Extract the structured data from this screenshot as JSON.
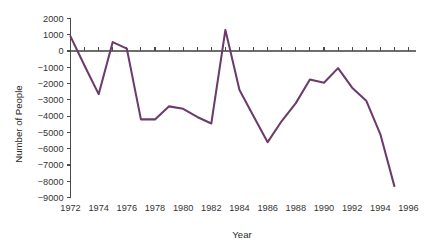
{
  "chart_data": {
    "type": "line",
    "title": "",
    "xlabel": "Year",
    "ylabel": "Number of People",
    "xlim": [
      1972,
      1996.5
    ],
    "ylim": [
      -9000,
      2000
    ],
    "grid": false,
    "legend": null,
    "line_color": "#6b3b6b",
    "axis_color": "#4a4a4a",
    "text_color": "#333333",
    "background_color": "#ffffff",
    "x_tick_labels": [
      "1972",
      "1974",
      "1976",
      "1978",
      "1980",
      "1982",
      "1984",
      "1986",
      "1988",
      "1990",
      "1992",
      "1994",
      "1996"
    ],
    "x_tick_values": [
      1972,
      1974,
      1976,
      1978,
      1980,
      1982,
      1984,
      1986,
      1988,
      1990,
      1992,
      1994,
      1996
    ],
    "x_minor_tick_values": [
      1973,
      1975,
      1977,
      1979,
      1981,
      1983,
      1985,
      1987,
      1989,
      1991,
      1993,
      1995
    ],
    "y_tick_labels": [
      "2000",
      "1000",
      "0",
      "−1000",
      "−2000",
      "−3000",
      "−4000",
      "−5000",
      "−6000",
      "−7000",
      "−8000",
      "−9000"
    ],
    "y_tick_values": [
      2000,
      1000,
      0,
      -1000,
      -2000,
      -3000,
      -4000,
      -5000,
      -6000,
      -7000,
      -8000,
      -9000
    ],
    "x": [
      1972,
      1973,
      1974,
      1975,
      1976,
      1977,
      1978,
      1979,
      1980,
      1981,
      1982,
      1983,
      1984,
      1985,
      1986,
      1987,
      1988,
      1989,
      1990,
      1991,
      1992,
      1993,
      1994,
      1995
    ],
    "values": [
      900,
      -900,
      -2650,
      550,
      150,
      -4200,
      -4200,
      -3400,
      -3550,
      -4050,
      -4450,
      1300,
      -2400,
      -4000,
      -5600,
      -4300,
      -3200,
      -1750,
      -1950,
      -1050,
      -2250,
      -3050,
      -5100,
      -8300
    ],
    "series": [
      {
        "name": "Number of People",
        "color": "#6b3b6b",
        "values": [
          900,
          -900,
          -2650,
          550,
          150,
          -4200,
          -4200,
          -3400,
          -3550,
          -4050,
          -4450,
          1300,
          -2400,
          -4000,
          -5600,
          -4300,
          -3200,
          -1750,
          -1950,
          -1050,
          -2250,
          -3050,
          -5100,
          -8300
        ]
      }
    ]
  }
}
